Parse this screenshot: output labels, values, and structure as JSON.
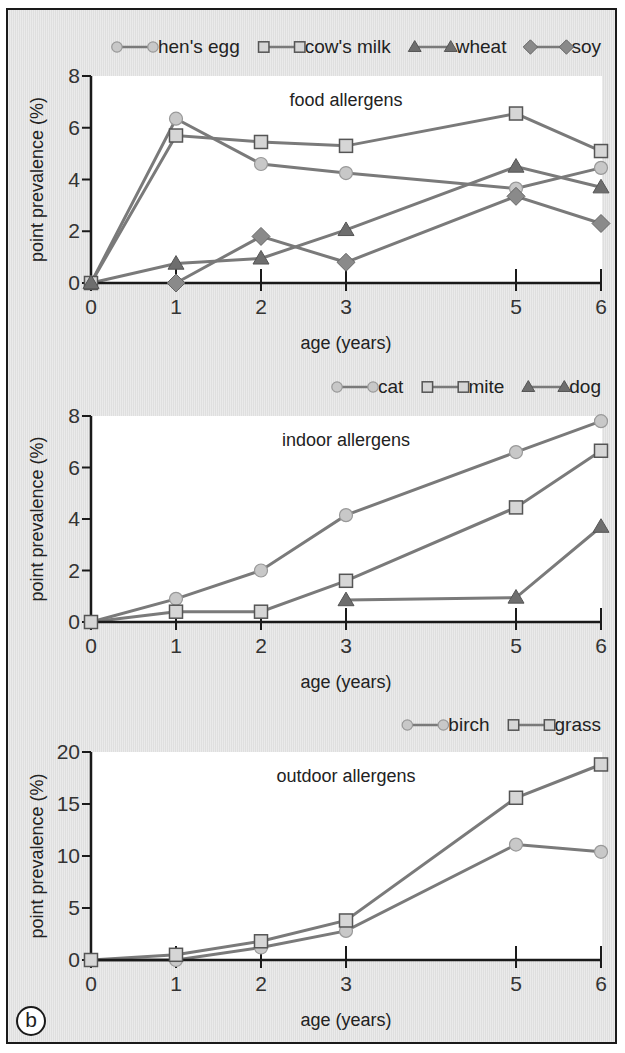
{
  "panel_label": "b",
  "colors": {
    "frame_bg": "#e6e6e6",
    "plot_bg": "#ffffff",
    "axis": "#1a1a1a",
    "line": "#7a7a7a",
    "circle_fill": "#c8c8c8",
    "square_fill": "#d6d6d6",
    "triangle_fill": "#6e6e6e",
    "diamond_fill": "#8a8a8a"
  },
  "chart_data": [
    {
      "type": "line",
      "title": "food allergens",
      "xlabel": "age (years)",
      "ylabel": "point prevalence (%)",
      "x_ticks": [
        0,
        1,
        2,
        3,
        5,
        6
      ],
      "y_ticks": [
        0,
        2,
        4,
        6,
        8
      ],
      "ylim": [
        0,
        8
      ],
      "xlim": [
        0,
        6
      ],
      "grid": false,
      "legend_position": "top-right, above plot",
      "series": [
        {
          "name": "hen's egg",
          "marker": "circle",
          "x": [
            0,
            1,
            2,
            3,
            5,
            6
          ],
          "values": [
            0,
            6.35,
            4.6,
            4.25,
            3.65,
            4.45
          ]
        },
        {
          "name": "cow's milk",
          "marker": "square",
          "x": [
            0,
            1,
            2,
            3,
            5,
            6
          ],
          "values": [
            0,
            5.7,
            5.45,
            5.3,
            6.55,
            5.1
          ]
        },
        {
          "name": "wheat",
          "marker": "triangle",
          "x": [
            0,
            1,
            2,
            3,
            5,
            6
          ],
          "values": [
            0,
            0.75,
            0.95,
            2.05,
            4.5,
            3.7
          ]
        },
        {
          "name": "soy",
          "marker": "diamond",
          "x": [
            1,
            2,
            3,
            5,
            6
          ],
          "values": [
            0,
            1.8,
            0.8,
            3.35,
            2.3
          ]
        }
      ]
    },
    {
      "type": "line",
      "title": "indoor allergens",
      "xlabel": "age (years)",
      "ylabel": "point prevalence (%)",
      "x_ticks": [
        0,
        1,
        2,
        3,
        5,
        6
      ],
      "y_ticks": [
        0,
        2,
        4,
        6,
        8
      ],
      "ylim": [
        0,
        8
      ],
      "xlim": [
        0,
        6
      ],
      "grid": false,
      "legend_position": "top-right, above plot",
      "series": [
        {
          "name": "cat",
          "marker": "circle",
          "x": [
            0,
            1,
            2,
            3,
            5,
            6
          ],
          "values": [
            0,
            0.9,
            2.0,
            4.15,
            6.6,
            7.8
          ]
        },
        {
          "name": "mite",
          "marker": "square",
          "x": [
            0,
            1,
            2,
            3,
            5,
            6
          ],
          "values": [
            0,
            0.4,
            0.4,
            1.6,
            4.45,
            6.65
          ]
        },
        {
          "name": "dog",
          "marker": "triangle",
          "x": [
            3,
            5,
            6
          ],
          "values": [
            0.85,
            0.95,
            3.7
          ]
        }
      ]
    },
    {
      "type": "line",
      "title": "outdoor allergens",
      "xlabel": "age (years)",
      "ylabel": "point prevalence (%)",
      "x_ticks": [
        0,
        1,
        2,
        3,
        5,
        6
      ],
      "y_ticks": [
        0,
        5,
        10,
        15,
        20
      ],
      "ylim": [
        0,
        20
      ],
      "xlim": [
        0,
        6
      ],
      "grid": false,
      "legend_position": "top-right, above plot",
      "series": [
        {
          "name": "birch",
          "marker": "circle",
          "x": [
            0,
            1,
            2,
            3,
            5,
            6
          ],
          "values": [
            0,
            0,
            1.2,
            2.8,
            11.1,
            10.4
          ]
        },
        {
          "name": "grass",
          "marker": "square",
          "x": [
            0,
            1,
            2,
            3,
            5,
            6
          ],
          "values": [
            0,
            0.5,
            1.8,
            3.8,
            15.6,
            18.8
          ]
        }
      ]
    }
  ]
}
